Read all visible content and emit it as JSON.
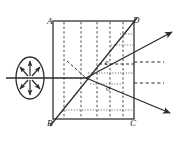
{
  "figure": {
    "colors": {
      "stroke": "#2b2b2b",
      "construction": "#555555",
      "background": "#ffffff"
    },
    "labels": {
      "A": "A",
      "B": "B",
      "C": "C",
      "D": "D",
      "e_ray": "e",
      "o_ray": "o"
    },
    "crystal": {
      "name": "crystal-block",
      "corners": {
        "A": [
          53,
          21
        ],
        "B": [
          53,
          119
        ],
        "C": [
          134,
          119
        ],
        "D": [
          134,
          21
        ]
      }
    },
    "optic_axis_lines": {
      "name": "optic-axis-dashed-lines",
      "style": "dashed",
      "count": 5,
      "x_positions": [
        64,
        81,
        97,
        110,
        123
      ],
      "y_top": 21,
      "y_bottom": 119
    },
    "diagonal_BD": {
      "name": "diagonal-wavefront-line",
      "from": [
        50,
        126
      ],
      "to": [
        136,
        19
      ]
    },
    "incident_ray": {
      "name": "incident-ray",
      "from": [
        6,
        78
      ],
      "to": [
        86,
        78
      ],
      "style": "solid"
    },
    "polarization_source": {
      "name": "unpolarized-light-symbol",
      "center": [
        30,
        78
      ],
      "rx": 14,
      "ry": 21,
      "arrow_count": 8,
      "description": "ellipse with radiating double arrows representing unpolarized light"
    },
    "split_point": [
      86,
      78
    ],
    "e_ray": {
      "name": "extraordinary-ray",
      "from": [
        86,
        78
      ],
      "to": [
        172,
        32
      ],
      "exit_at": [
        134,
        62
      ]
    },
    "o_ray": {
      "name": "ordinary-ray",
      "from": [
        86,
        78
      ],
      "to": [
        170,
        113
      ],
      "exit_at": [
        134,
        94
      ]
    },
    "dashed_reference_lines": [
      {
        "name": "e-ray-reference-dashed",
        "from": [
          134,
          62
        ],
        "to": [
          163,
          62
        ]
      },
      {
        "name": "o-ray-reference-dashed",
        "from": [
          134,
          83
        ],
        "to": [
          163,
          83
        ]
      },
      {
        "name": "internal-e-dashed",
        "from": [
          99,
          64
        ],
        "to": [
          134,
          64
        ]
      }
    ],
    "dotted_lines": [
      {
        "name": "dotted-wavefront-1",
        "from": [
          111,
          45
        ],
        "to": [
          134,
          45
        ]
      },
      {
        "name": "dotted-wavefront-2",
        "from": [
          120,
          34
        ],
        "to": [
          134,
          34
        ]
      },
      {
        "name": "dotted-wavefront-3",
        "from": [
          88,
          73
        ],
        "to": [
          134,
          73
        ]
      },
      {
        "name": "dotted-wavefront-4",
        "from": [
          90,
          84
        ],
        "to": [
          120,
          84
        ]
      },
      {
        "name": "dotted-wavefront-5",
        "from": [
          63,
          110
        ],
        "to": [
          134,
          110
        ]
      }
    ],
    "short_dashed_construction": {
      "name": "huygens-construction-dashed",
      "from": [
        68,
        62
      ],
      "to": [
        88,
        78
      ]
    }
  }
}
